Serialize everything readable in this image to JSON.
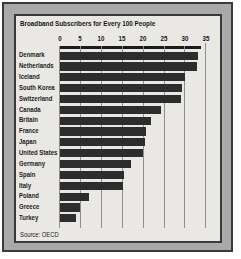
{
  "title": "Broadband Subscribers for Every 100 People",
  "source": "Source: OECD",
  "chart_data": {
    "type": "bar",
    "orientation": "horizontal",
    "title": "Broadband Subscribers for Every 100 People",
    "categories": [
      "Denmark",
      "Netherlands",
      "Iceland",
      "South Korea",
      "Switzerland",
      "Canada",
      "Britain",
      "France",
      "Japan",
      "United States",
      "Germany",
      "Spain",
      "Italy",
      "Poland",
      "Greece",
      "Turkey"
    ],
    "values": [
      32.9,
      32.7,
      29.9,
      29.2,
      29.0,
      24.2,
      21.8,
      20.5,
      20.3,
      19.8,
      17.0,
      15.4,
      15.0,
      7.0,
      4.7,
      3.9
    ],
    "xlabel": "",
    "ylabel": "",
    "xlim": [
      0,
      35
    ],
    "x_ticks": [
      0,
      5,
      10,
      15,
      20,
      25,
      30,
      35
    ],
    "grid": true,
    "legend": false,
    "source": "Source: OECD",
    "bar_color": "#2d2d2d",
    "panel_bg": "#e9e8e5",
    "frame_bg": "#a9a9a9",
    "gridline_color": "#8f8f8f"
  }
}
